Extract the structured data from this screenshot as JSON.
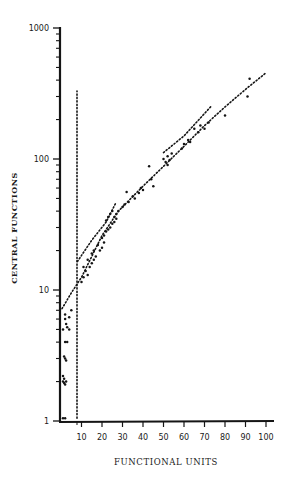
{
  "chart_data": {
    "type": "scatter",
    "title": "",
    "xlabel": "FUNCTIONAL UNITS",
    "ylabel": "CENTRAL FUNCTIONS",
    "xscale": "linear",
    "yscale": "log",
    "xlim": [
      0,
      103
    ],
    "ylim": [
      1,
      1000
    ],
    "grid": false,
    "legend": null,
    "x_ticks": [
      10,
      20,
      30,
      40,
      50,
      60,
      70,
      80,
      90,
      100
    ],
    "x_tick_labels": [
      "10",
      "20",
      "30",
      "40",
      "50",
      "60",
      "70",
      "80",
      "90",
      "100"
    ],
    "y_major_ticks": [
      1,
      10,
      100,
      1000
    ],
    "y_tick_labels": [
      "1",
      "10",
      "100",
      "1000"
    ],
    "y_minor_ticks": [
      2,
      3,
      4,
      5,
      6,
      7,
      8,
      9,
      20,
      30,
      40,
      50,
      60,
      70,
      80,
      90,
      200,
      300,
      400,
      500,
      600,
      700,
      800,
      900
    ],
    "series": [
      {
        "name": "observations",
        "style": "points",
        "points": [
          [
            1,
            1.05
          ],
          [
            2,
            1.05
          ],
          [
            1,
            2.0
          ],
          [
            1.5,
            2.1
          ],
          [
            2,
            1.9
          ],
          [
            1,
            2.2
          ],
          [
            2.5,
            2.0
          ],
          [
            1.5,
            1.95
          ],
          [
            2,
            3.0
          ],
          [
            2.5,
            2.9
          ],
          [
            1.5,
            3.1
          ],
          [
            2,
            4.0
          ],
          [
            3,
            4.0
          ],
          [
            1,
            5.0
          ],
          [
            3,
            5.2
          ],
          [
            4,
            5.0
          ],
          [
            2.5,
            5.5
          ],
          [
            2,
            6.0
          ],
          [
            4,
            6.2
          ],
          [
            5,
            7.0
          ],
          [
            2,
            6.5
          ],
          [
            10,
            11.5
          ],
          [
            11,
            12.5
          ],
          [
            12,
            14
          ],
          [
            13,
            13
          ],
          [
            14,
            15
          ],
          [
            15,
            16
          ],
          [
            16,
            17
          ],
          [
            17,
            18
          ],
          [
            11,
            15
          ],
          [
            13,
            17
          ],
          [
            15,
            19
          ],
          [
            16,
            20
          ],
          [
            18,
            22
          ],
          [
            19,
            20
          ],
          [
            20,
            21
          ],
          [
            21,
            23
          ],
          [
            20,
            25
          ],
          [
            21,
            26
          ],
          [
            22,
            28
          ],
          [
            23,
            29
          ],
          [
            24,
            30
          ],
          [
            25,
            32
          ],
          [
            26,
            33
          ],
          [
            27,
            35
          ],
          [
            22,
            34
          ],
          [
            23,
            36
          ],
          [
            24,
            38
          ],
          [
            25,
            40
          ],
          [
            26,
            36
          ],
          [
            27,
            38
          ],
          [
            28,
            40
          ],
          [
            30,
            43
          ],
          [
            31,
            45
          ],
          [
            32,
            56
          ],
          [
            33,
            47
          ],
          [
            35,
            52
          ],
          [
            36,
            50
          ],
          [
            38,
            55
          ],
          [
            39,
            60
          ],
          [
            40,
            58
          ],
          [
            43,
            88
          ],
          [
            45,
            62
          ],
          [
            44,
            70
          ],
          [
            50,
            100
          ],
          [
            51,
            95
          ],
          [
            52,
            90
          ],
          [
            53,
            98
          ],
          [
            52,
            105
          ],
          [
            54,
            110
          ],
          [
            59,
            120
          ],
          [
            60,
            130
          ],
          [
            62,
            140
          ],
          [
            63,
            135
          ],
          [
            65,
            170
          ],
          [
            67,
            160
          ],
          [
            68,
            180
          ],
          [
            70,
            170
          ],
          [
            72,
            190
          ],
          [
            80,
            215
          ],
          [
            91,
            300
          ],
          [
            92,
            410
          ]
        ]
      },
      {
        "name": "vertical-threshold",
        "style": "dotted-line",
        "points": [
          [
            7.8,
            1.05
          ],
          [
            7.8,
            330
          ]
        ]
      },
      {
        "name": "lower-trend",
        "style": "dotted-line",
        "points": [
          [
            0.5,
            7.2
          ],
          [
            5,
            9.5
          ],
          [
            10,
            12.5
          ],
          [
            20,
            26
          ],
          [
            28,
            40
          ],
          [
            40,
            62
          ],
          [
            50,
            88
          ],
          [
            60,
            125
          ],
          [
            70,
            180
          ],
          [
            80,
            250
          ],
          [
            90,
            340
          ],
          [
            100,
            455
          ]
        ]
      },
      {
        "name": "upper-trend",
        "style": "dotted-line",
        "points": [
          [
            8,
            16.5
          ],
          [
            15,
            24
          ],
          [
            22,
            33
          ],
          [
            27,
            47
          ]
        ]
      },
      {
        "name": "upper-trend-2",
        "style": "dotted-line",
        "points": [
          [
            50,
            112
          ],
          [
            60,
            150
          ],
          [
            73,
            250
          ]
        ]
      }
    ]
  }
}
